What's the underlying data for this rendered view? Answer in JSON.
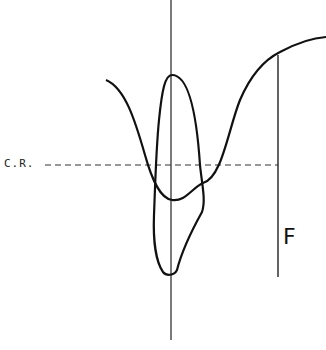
{
  "diagram": {
    "labels": {
      "reference_line": "C.R.",
      "marker": "F"
    },
    "elements": [
      {
        "type": "vertical-axis",
        "description": "central vertical reference line"
      },
      {
        "type": "dashed-line",
        "description": "horizontal dashed reference line labeled C.R."
      },
      {
        "type": "wave-curve",
        "description": "curve descending to a minimum at axis then rising to a plateau on the right"
      },
      {
        "type": "closed-loop",
        "description": "elongated loop straddling the vertical axis"
      },
      {
        "type": "marker-line",
        "description": "vertical line labeled F dropping from the curve"
      }
    ],
    "colors": {
      "stroke": "#111111",
      "background": "#ffffff"
    }
  }
}
